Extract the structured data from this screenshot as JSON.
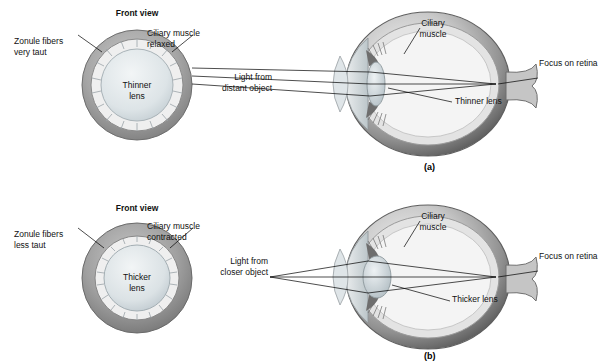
{
  "figure": {
    "panels": [
      {
        "id": "a",
        "tag": "(a)",
        "front_view_title": "Front view",
        "front_view_labels": {
          "zonule": "Zonule fibers\nvery taut",
          "ciliary": "Ciliary muscle\nrelaxed",
          "lens": "Thinner\nlens"
        },
        "side_view_labels": {
          "ciliary": "Ciliary\nmuscle",
          "light": "Light from\ndistant object",
          "lens": "Thinner lens",
          "focus": "Focus on retina"
        }
      },
      {
        "id": "b",
        "tag": "(b)",
        "front_view_title": "Front view",
        "front_view_labels": {
          "zonule": "Zonule fibers\nless taut",
          "ciliary": "Ciliary muscle\ncontracted",
          "lens": "Thicker\nlens"
        },
        "side_view_labels": {
          "ciliary": "Ciliary\nmuscle",
          "light": "Light from\ncloser object",
          "lens": "Thicker lens",
          "focus": "Focus on retina"
        }
      }
    ],
    "colors": {
      "sclera_outer": "#9a9a9a",
      "sclera_inner": "#d8d8d8",
      "lens_fill": "#b9c6cc",
      "lens_fill_light": "#e4e9ec",
      "eye_dark": "#4a4a4a",
      "eye_mid": "#8d8d8d",
      "eye_light": "#e8e8e8",
      "leader_line": "#000000"
    }
  }
}
